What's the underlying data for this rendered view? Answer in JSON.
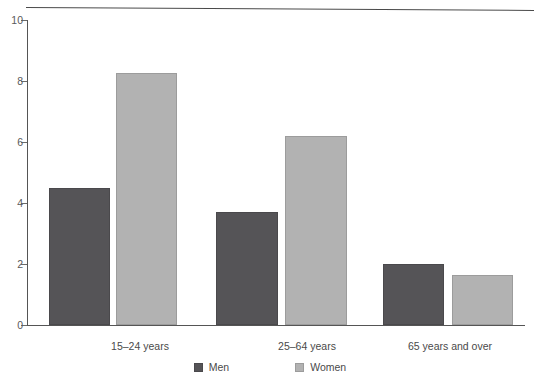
{
  "chart_data": {
    "type": "bar",
    "title": "",
    "subtitle": "",
    "xlabel": "",
    "ylabel": "",
    "categories": [
      "15–24 years",
      "25–64 years",
      "65 years and over"
    ],
    "series": [
      {
        "name": "Men",
        "color": "#555457",
        "values": [
          4.5,
          3.7,
          2.0
        ]
      },
      {
        "name": "Women",
        "color": "#b2b2b2",
        "values": [
          8.25,
          6.2,
          1.65
        ]
      }
    ],
    "ylim": [
      0,
      10
    ],
    "ytick_labels": [
      "0",
      "2",
      "4",
      "6",
      "8",
      "10"
    ],
    "ytick_values": [
      0,
      2,
      4,
      6,
      8,
      10
    ],
    "grid": false,
    "legend_position": "bottom",
    "annotations": []
  },
  "legend": {
    "items": [
      {
        "label": "Men",
        "swatch": "men-swatch"
      },
      {
        "label": "Women",
        "swatch": "women-swatch"
      }
    ]
  }
}
